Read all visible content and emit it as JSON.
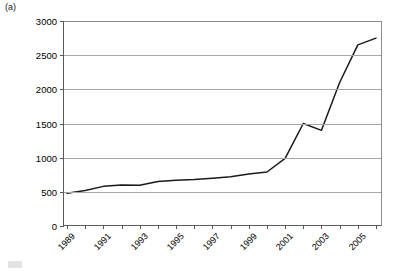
{
  "panel": {
    "label": "(a)"
  },
  "chart_data": {
    "type": "line",
    "title": "",
    "xlabel": "",
    "ylabel": "",
    "ylim": [
      0,
      3000
    ],
    "ytick_step": 500,
    "yticks": [
      0,
      500,
      1000,
      1500,
      2000,
      2500,
      3000
    ],
    "ytick_labels": [
      "0",
      "500",
      "1000",
      "1500",
      "2000",
      "2500",
      "3000"
    ],
    "grid": true,
    "grid_axis": "y",
    "legend": null,
    "legend_position": "none",
    "xlim": [
      1989,
      2006
    ],
    "x": [
      1989,
      1990,
      1991,
      1992,
      1993,
      1994,
      1995,
      1996,
      1997,
      1998,
      1999,
      2000,
      2001,
      2002,
      2003,
      2004,
      2005,
      2006
    ],
    "xtick_labels_shown": [
      "1989",
      "1991",
      "1993",
      "1995",
      "1997",
      "1999",
      "2001",
      "2003",
      "2005"
    ],
    "xtick_label_rotation": -45,
    "series": [
      {
        "name": "series-1",
        "color": "#1a1a1a",
        "values": [
          480,
          520,
          580,
          600,
          595,
          650,
          670,
          680,
          700,
          720,
          760,
          790,
          990,
          1500,
          1400,
          2100,
          2650,
          2750
        ]
      }
    ]
  }
}
